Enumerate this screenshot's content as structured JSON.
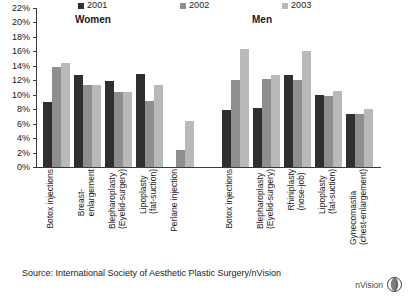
{
  "chart_data": {
    "type": "bar",
    "title": "",
    "xlabel": "",
    "ylabel": "",
    "ylim": [
      0,
      22
    ],
    "ytick_step": 2,
    "ytick_labels": [
      "22%",
      "20%",
      "18%",
      "16%",
      "14%",
      "12%",
      "10%",
      "8%",
      "6%",
      "4%",
      "2%",
      "0%"
    ],
    "grid": false,
    "legend_position": "top",
    "panels": [
      {
        "name": "Women",
        "categories": [
          "Botox injections",
          "Breast-\nenlargement",
          "Blepharoplasty\n(Eyelid-surgery)",
          "Lipoplasty\n(fat-suction)",
          "Perlane injection"
        ],
        "series": [
          {
            "name": "2001",
            "values": [
              9.0,
              12.7,
              11.9,
              12.9,
              null
            ]
          },
          {
            "name": "2002",
            "values": [
              13.8,
              11.3,
              10.4,
              9.1,
              2.3
            ]
          },
          {
            "name": "2003",
            "values": [
              14.4,
              11.3,
              10.4,
              11.4,
              6.4
            ]
          }
        ]
      },
      {
        "name": "Men",
        "categories": [
          "Botox injections",
          "Blepharoplasty\n(Eyelid-surgery)",
          "Rhiniplasty\n(nose-job)",
          "Lipoplasty\n(fat-suction)",
          "Gynecomastia\n(chest-enlargement)"
        ],
        "series": [
          {
            "name": "2001",
            "values": [
              7.9,
              8.2,
              12.8,
              9.9,
              7.4
            ]
          },
          {
            "name": "2002",
            "values": [
              12.1,
              12.2,
              12.0,
              9.8,
              7.3
            ]
          },
          {
            "name": "2003",
            "values": [
              16.3,
              12.7,
              16.1,
              10.5,
              8.0
            ]
          }
        ]
      }
    ]
  },
  "legend": {
    "items": [
      {
        "label": "2001",
        "color": "#2f2f2f"
      },
      {
        "label": "2002",
        "color": "#8e8e8e"
      },
      {
        "label": "2003",
        "color": "#b9b9b9"
      }
    ]
  },
  "panel_titles": {
    "women": "Women",
    "men": "Men"
  },
  "footer": {
    "source": "Source: International Society of Aesthetic Plastic Surgery/nVision",
    "logo_text": "nVision"
  },
  "colors": {
    "series_2001": "#2f2f2f",
    "series_2002": "#8e8e8e",
    "series_2003": "#b9b9b9",
    "axis": "#3a3a3a",
    "background": "#ffffff"
  }
}
